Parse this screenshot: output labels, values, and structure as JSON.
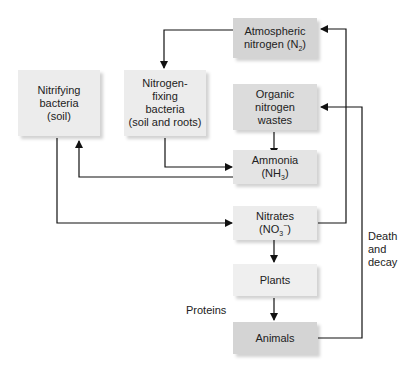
{
  "nodes": {
    "atmospheric": {
      "line1": "Atmospheric",
      "line2": "nitrogen (N",
      "sub": "2",
      "line2_end": ")",
      "color": "#d4d4d4"
    },
    "nitrifying": {
      "line1": "Nitrifying",
      "line2": "bacteria",
      "line3": "(soil)",
      "color": "#ececec"
    },
    "fixing": {
      "line1": "Nitrogen-",
      "line2": "fixing",
      "line3": "bacteria",
      "line4": "(soil and roots)",
      "color": "#ececec"
    },
    "wastes": {
      "line1": "Organic",
      "line2": "nitrogen",
      "line3": "wastes",
      "color": "#dcdcdc"
    },
    "ammonia": {
      "line1": "Ammonia",
      "line2": "(NH",
      "sub": "3",
      "line2_end": ")",
      "color": "#e4e4e4"
    },
    "nitrates": {
      "line1": "Nitrates",
      "line2": "(NO",
      "sub": "3",
      "sup": "−",
      "line2_end": ")",
      "color": "#ececec"
    },
    "plants": {
      "label": "Plants",
      "color": "#efefef"
    },
    "animals": {
      "label": "Animals",
      "color": "#d4d4d4"
    }
  },
  "labels": {
    "proteins": "Proteins",
    "death1": "Death",
    "death2": "and",
    "death3": "decay"
  }
}
